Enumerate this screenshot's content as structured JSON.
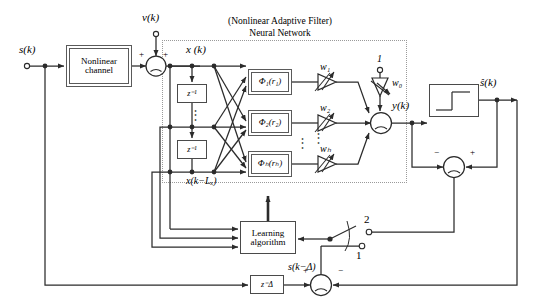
{
  "figure": {
    "title_line1": "(Nonlinear Adaptive Filter)",
    "title_line2": "Neural Network"
  },
  "signals": {
    "input": "s(k)",
    "noise": "ν(k)",
    "channel_output": "x (k)",
    "tap_last": "x(k−Lₓ)",
    "net_output": "y(k)",
    "decision_output": "ŝ(k)",
    "delayed_reference": "s(k−Δ)",
    "bias_input": "1"
  },
  "blocks": {
    "channel_line1": "Nonlinear",
    "channel_line2": "channel",
    "delay_unit": "z⁻¹",
    "delay_bulk": "z⁻Δ",
    "learning_line1": "Learning",
    "learning_line2": "algorithm",
    "decision_device": "decision-device-step"
  },
  "basis_functions": [
    {
      "label": "Φ₁(r₁)"
    },
    {
      "label": "Φ₂(r₂)"
    },
    {
      "label": "Φₕ(rₕ)"
    }
  ],
  "weights": [
    {
      "label": "w₁"
    },
    {
      "label": "w₂"
    },
    {
      "label": "wₕ"
    }
  ],
  "bias_weight": "w₀",
  "switch": {
    "position_2": "2",
    "position_1": "1"
  },
  "summers": {
    "noise_plus_left": "+",
    "noise_plus_right": "+",
    "output_symbol": "Σ",
    "error_minus": "−",
    "error_plus": "+",
    "ref_plus": "+",
    "ref_minus": "−"
  },
  "vertical_dots": "⋮",
  "colors": {
    "line": "#2b2b2b",
    "block_border": "#4a4a4a",
    "dotted_border": "#9a9a9a",
    "text": "#000000"
  }
}
